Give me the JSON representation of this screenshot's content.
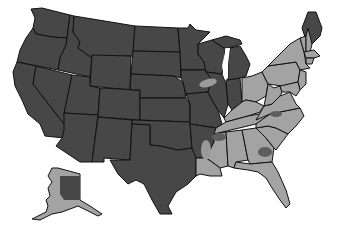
{
  "map": {
    "type": "choropleth",
    "region": "United States",
    "colors": {
      "category_dark": "#474747",
      "category_light": "#a3a3a3",
      "border": "#111111",
      "background": "#ffffff"
    },
    "categories": [
      {
        "name": "dark",
        "color": "#474747",
        "states": [
          "WA",
          "OR",
          "CA",
          "NV",
          "ID",
          "MT",
          "WY",
          "UT",
          "AZ",
          "CO",
          "NM",
          "ND",
          "SD",
          "NE",
          "KS",
          "OK",
          "TX",
          "MN",
          "IA",
          "MO",
          "WI",
          "MI",
          "IL",
          "IN",
          "AR",
          "ME"
        ]
      },
      {
        "name": "light",
        "color": "#a3a3a3",
        "states": [
          "OH",
          "KY",
          "TN",
          "MS",
          "AL",
          "GA",
          "FL",
          "SC",
          "NC",
          "VA",
          "WV",
          "PA",
          "NY",
          "NJ",
          "MD",
          "DE",
          "CT",
          "RI",
          "MA",
          "VT",
          "NH",
          "LA",
          "AK"
        ]
      }
    ],
    "overlay_patches": [
      {
        "location": "northern Illinois",
        "shade": "light"
      },
      {
        "location": "eastern Arkansas",
        "shade": "light"
      },
      {
        "location": "western Alaska",
        "shade": "light"
      },
      {
        "location": "northern Mississippi",
        "shade": "dark"
      },
      {
        "location": "central Georgia",
        "shade": "dark"
      },
      {
        "location": "north-central North Carolina",
        "shade": "dark"
      }
    ]
  }
}
